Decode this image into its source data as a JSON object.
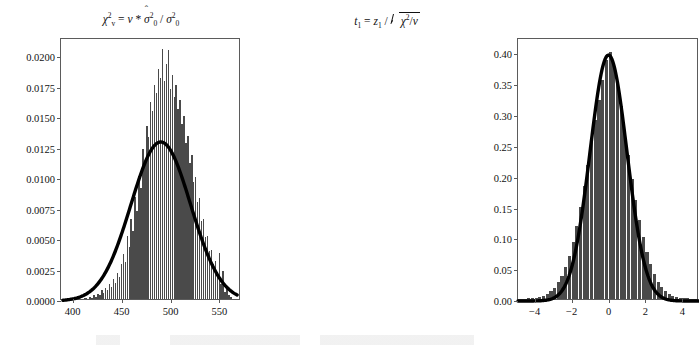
{
  "figure": {
    "background": "#ffffff",
    "bar_color": "#4a4a4a",
    "curve_color": "#000000",
    "axis_color": "#5b5b5b"
  },
  "chart_data": [
    {
      "type": "bar",
      "id": "chi-square-panel",
      "title": "chi^2_v = v * sigmahat_0^2 / sigma_0^2",
      "title_parts": {
        "chi": "χ",
        "chi_sup": "2",
        "chi_sub": "v",
        "equals": "=",
        "v": "v",
        "times": "*",
        "sigma_hat": "σ",
        "sigma_hat_mark": "ˆ",
        "sigma_hat_sup": "2",
        "sigma_hat_sub": "0",
        "slash": "/",
        "sigma": "σ",
        "sigma_sup": "2",
        "sigma_sub": "0"
      },
      "xlabel": "",
      "ylabel": "",
      "xlim": [
        388,
        572
      ],
      "ylim": [
        0.0,
        0.0215
      ],
      "grid": false,
      "legend": "none",
      "xticks": [
        400,
        450,
        500,
        550
      ],
      "xtick_labels": [
        "400",
        "450",
        "500",
        "550"
      ],
      "yticks": [
        0.0,
        0.0025,
        0.005,
        0.0075,
        0.01,
        0.0125,
        0.015,
        0.0175,
        0.02
      ],
      "ytick_labels": [
        "0.0000",
        "0.0025",
        "0.0050",
        "0.0075",
        "0.0100",
        "0.0125",
        "0.0150",
        "0.0175",
        "0.0200"
      ],
      "bin_width": 2,
      "bin_centers": [
        398,
        400,
        402,
        404,
        406,
        408,
        410,
        412,
        414,
        416,
        418,
        420,
        422,
        424,
        426,
        428,
        430,
        432,
        434,
        436,
        438,
        440,
        442,
        444,
        446,
        448,
        450,
        452,
        454,
        456,
        458,
        460,
        462,
        464,
        466,
        468,
        470,
        472,
        474,
        476,
        478,
        480,
        482,
        484,
        486,
        488,
        490,
        492,
        494,
        496,
        498,
        500,
        502,
        504,
        506,
        508,
        510,
        512,
        514,
        516,
        518,
        520,
        522,
        524,
        526,
        528,
        530,
        532,
        534,
        536,
        538,
        540,
        542,
        544,
        546,
        548,
        550,
        552,
        554,
        556,
        558,
        560,
        562
      ],
      "values": [
        0.0,
        5e-05,
        0.0,
        0.0,
        5e-05,
        0.0,
        0.0,
        0.0001,
        5e-05,
        0.0,
        0.0002,
        0.0001,
        0.0003,
        0.00015,
        0.00045,
        0.00035,
        0.0007,
        0.0005,
        0.0009,
        0.00075,
        0.0012,
        0.001,
        0.00165,
        0.0013,
        0.0021,
        0.0018,
        0.00285,
        0.0037,
        0.003,
        0.0052,
        0.0043,
        0.0066,
        0.0056,
        0.0084,
        0.0072,
        0.0101,
        0.0091,
        0.0123,
        0.0112,
        0.0142,
        0.0133,
        0.0162,
        0.0154,
        0.0176,
        0.0169,
        0.0189,
        0.0181,
        0.0205,
        0.0179,
        0.0193,
        0.0204,
        0.0172,
        0.0184,
        0.0166,
        0.0176,
        0.0156,
        0.0163,
        0.0144,
        0.015,
        0.0128,
        0.0134,
        0.0112,
        0.0118,
        0.0096,
        0.01,
        0.008,
        0.0083,
        0.0064,
        0.0066,
        0.0051,
        0.0052,
        0.0039,
        0.004,
        0.0029,
        0.0031,
        0.002,
        0.0038,
        0.0012,
        0.0023,
        0.0006,
        0.0009,
        0.0003,
        0.00015
      ],
      "overlay_curve": {
        "name": "normal approximation",
        "type": "line",
        "peak_x": 490,
        "peak_y": 0.01305,
        "sigma": 30.5,
        "x_start": 390,
        "y_start": 0.00018,
        "x_end": 568,
        "y_end": 0.00225
      }
    },
    {
      "type": "bar",
      "id": "t-distribution-panel",
      "title": "t_1 = z_1 / sqrt(chi^2 / v)",
      "title_parts": {
        "t": "t",
        "t_sub": "1",
        "equals": "=",
        "z": "z",
        "z_sub": "1",
        "slash": "/",
        "radical": "√",
        "chi": "χ",
        "chi_sup": "2",
        "inner_slash": "/",
        "v": "v"
      },
      "xlabel": "",
      "ylabel": "",
      "xlim": [
        -4.9,
        4.9
      ],
      "ylim": [
        0.0,
        0.425
      ],
      "grid": false,
      "legend": "none",
      "xticks": [
        -4,
        -2,
        0,
        2,
        4
      ],
      "xtick_labels": [
        "−4",
        "−2",
        "0",
        "2",
        "4"
      ],
      "yticks": [
        0.0,
        0.05,
        0.1,
        0.15,
        0.2,
        0.25,
        0.3,
        0.35,
        0.4
      ],
      "ytick_labels": [
        "0.00",
        "0.05",
        "0.10",
        "0.15",
        "0.20",
        "0.25",
        "0.30",
        "0.35",
        "0.40"
      ],
      "bin_width": 0.2,
      "bin_centers": [
        -4.7,
        -4.5,
        -4.3,
        -4.1,
        -3.9,
        -3.7,
        -3.5,
        -3.3,
        -3.1,
        -2.9,
        -2.7,
        -2.5,
        -2.3,
        -2.1,
        -1.9,
        -1.7,
        -1.5,
        -1.3,
        -1.1,
        -0.9,
        -0.7,
        -0.5,
        -0.3,
        -0.1,
        0.1,
        0.3,
        0.5,
        0.7,
        0.9,
        1.1,
        1.3,
        1.5,
        1.7,
        1.9,
        2.1,
        2.3,
        2.5,
        2.7,
        2.9,
        3.1,
        3.3,
        3.5,
        3.7,
        3.9,
        4.1,
        4.3,
        4.5,
        4.7
      ],
      "values": [
        0.0005,
        0.0008,
        0.001,
        0.0015,
        0.0022,
        0.0035,
        0.0055,
        0.0085,
        0.0125,
        0.0185,
        0.027,
        0.038,
        0.052,
        0.07,
        0.092,
        0.118,
        0.149,
        0.183,
        0.218,
        0.255,
        0.29,
        0.323,
        0.356,
        0.388,
        0.4,
        0.379,
        0.348,
        0.313,
        0.272,
        0.233,
        0.195,
        0.16,
        0.128,
        0.1,
        0.076,
        0.056,
        0.04,
        0.028,
        0.019,
        0.013,
        0.0085,
        0.0055,
        0.0035,
        0.0022,
        0.0014,
        0.0009,
        0.0006,
        0.0004
      ],
      "overlay_curve": {
        "name": "standard normal",
        "type": "line",
        "peak_x": 0,
        "peak_y": 0.399,
        "sigma": 1.0,
        "x_start": -4.9,
        "y_start": 0.0004,
        "x_end": 4.9,
        "y_end": 0.0004
      }
    }
  ]
}
